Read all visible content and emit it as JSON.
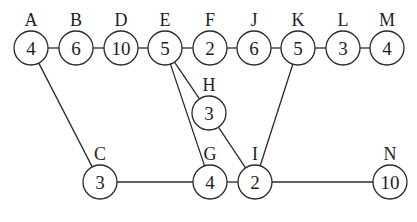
{
  "diagram": {
    "type": "network-graph",
    "nodes": [
      {
        "id": "A",
        "value": "4",
        "x": 31,
        "y": 48
      },
      {
        "id": "B",
        "value": "6",
        "x": 76,
        "y": 48
      },
      {
        "id": "D",
        "value": "10",
        "x": 121,
        "y": 48
      },
      {
        "id": "E",
        "value": "5",
        "x": 165,
        "y": 48
      },
      {
        "id": "F",
        "value": "2",
        "x": 210,
        "y": 48
      },
      {
        "id": "J",
        "value": "6",
        "x": 254,
        "y": 48
      },
      {
        "id": "K",
        "value": "5",
        "x": 298,
        "y": 48
      },
      {
        "id": "L",
        "value": "3",
        "x": 343,
        "y": 48
      },
      {
        "id": "M",
        "value": "4",
        "x": 387,
        "y": 48
      },
      {
        "id": "H",
        "value": "3",
        "x": 209,
        "y": 113
      },
      {
        "id": "C",
        "value": "3",
        "x": 100,
        "y": 182
      },
      {
        "id": "G",
        "value": "4",
        "x": 210,
        "y": 182
      },
      {
        "id": "I",
        "value": "2",
        "x": 255,
        "y": 182
      },
      {
        "id": "N",
        "value": "10",
        "x": 390,
        "y": 182
      }
    ],
    "edges": [
      [
        "A",
        "B"
      ],
      [
        "B",
        "D"
      ],
      [
        "D",
        "E"
      ],
      [
        "E",
        "F"
      ],
      [
        "F",
        "J"
      ],
      [
        "J",
        "K"
      ],
      [
        "K",
        "L"
      ],
      [
        "L",
        "M"
      ],
      [
        "A",
        "C"
      ],
      [
        "C",
        "G"
      ],
      [
        "G",
        "I"
      ],
      [
        "I",
        "N"
      ],
      [
        "E",
        "G"
      ],
      [
        "E",
        "H"
      ],
      [
        "H",
        "I"
      ],
      [
        "K",
        "I"
      ]
    ],
    "node_radius": 17,
    "stroke_color": "#2a2a2a"
  }
}
